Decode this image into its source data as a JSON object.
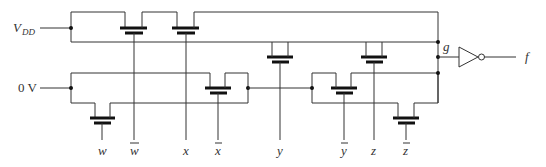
{
  "diagram": {
    "type": "pass-transistor-logic-circuit",
    "supply_labels": {
      "vdd_main": "V",
      "vdd_sub": "DD",
      "ground": "0 V"
    },
    "inputs": [
      {
        "name": "w",
        "label": "w",
        "complemented": false
      },
      {
        "name": "w_bar",
        "label": "w",
        "complemented": true
      },
      {
        "name": "x",
        "label": "x",
        "complemented": false
      },
      {
        "name": "x_bar",
        "label": "x",
        "complemented": true
      },
      {
        "name": "y",
        "label": "y",
        "complemented": false
      },
      {
        "name": "y_bar",
        "label": "y",
        "complemented": true
      },
      {
        "name": "z",
        "label": "z",
        "complemented": false
      },
      {
        "name": "z_bar",
        "label": "z",
        "complemented": true
      }
    ],
    "internal_node": "g",
    "output": "f",
    "gate": "inverter",
    "colors": {
      "wire": "#333333",
      "transistor": "#111111",
      "background": "#ffffff"
    }
  }
}
